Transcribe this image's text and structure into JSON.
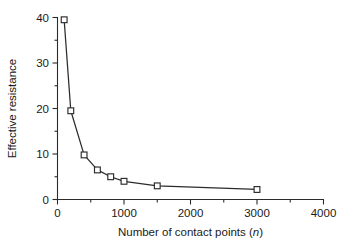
{
  "chart_data": {
    "type": "line",
    "title": "",
    "xlabel": "Number of contact points (n)",
    "xlabel_plain": "Number of contact points (",
    "xlabel_italic": "n",
    "xlabel_close": ")",
    "ylabel": "Effective resistance",
    "xlim": [
      0,
      4000
    ],
    "ylim": [
      0,
      40
    ],
    "x_major_ticks": [
      0,
      1000,
      2000,
      3000,
      4000
    ],
    "x_minor_ticks": [
      500,
      1500,
      2500,
      3500
    ],
    "y_major_ticks": [
      0,
      10,
      20,
      30,
      40
    ],
    "y_minor_ticks": [
      5,
      15,
      25,
      35
    ],
    "x_tick_labels": [
      "0",
      "1000",
      "2000",
      "3000",
      "4000"
    ],
    "y_tick_labels": [
      "0",
      "10",
      "20",
      "30",
      "40"
    ],
    "grid": false,
    "legend": null,
    "marker": "open-square",
    "line_color": "#2b2b2b",
    "marker_fill": "#ffffff",
    "marker_edge_color": "#2b2b2b",
    "background_color": "#ffffff",
    "series": [
      {
        "name": "Effective resistance",
        "x": [
          100,
          200,
          400,
          600,
          800,
          1000,
          1500,
          3000
        ],
        "values": [
          39.5,
          19.5,
          9.8,
          6.5,
          5.0,
          4.0,
          3.0,
          2.2
        ]
      }
    ],
    "points": [
      {
        "x": 100,
        "y": 39.5
      },
      {
        "x": 200,
        "y": 19.5
      },
      {
        "x": 400,
        "y": 9.8
      },
      {
        "x": 600,
        "y": 6.5
      },
      {
        "x": 800,
        "y": 5.0
      },
      {
        "x": 1000,
        "y": 4.0
      },
      {
        "x": 1500,
        "y": 3.0
      },
      {
        "x": 3000,
        "y": 2.2
      }
    ]
  }
}
